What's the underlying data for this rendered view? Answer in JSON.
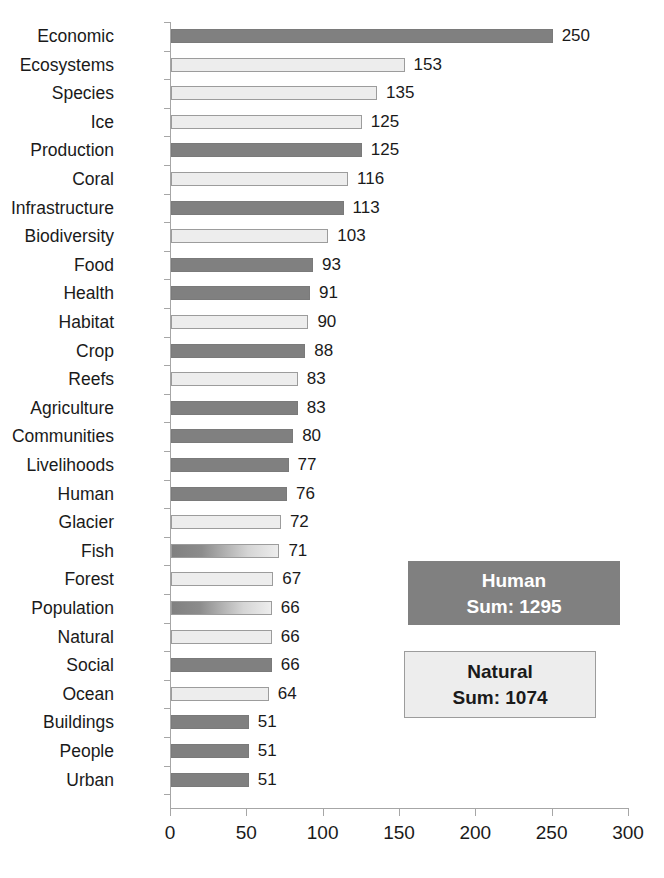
{
  "chart_data": {
    "type": "bar",
    "orientation": "horizontal",
    "title": "",
    "xlabel": "",
    "ylabel": "",
    "xlim": [
      0,
      300
    ],
    "xticks": [
      0,
      50,
      100,
      150,
      200,
      250,
      300
    ],
    "grid": false,
    "legend_position": "inside-right",
    "categories": [
      "Economic",
      "Ecosystems",
      "Species",
      "Ice",
      "Production",
      "Coral",
      "Infrastructure",
      "Biodiversity",
      "Food",
      "Health",
      "Habitat",
      "Crop",
      "Reefs",
      "Agriculture",
      "Communities",
      "Livelihoods",
      "Human",
      "Glacier",
      "Fish",
      "Forest",
      "Population",
      "Natural",
      "Social",
      "Ocean",
      "Buildings",
      "People",
      "Urban"
    ],
    "values": [
      250,
      153,
      135,
      125,
      125,
      116,
      113,
      103,
      93,
      91,
      90,
      88,
      83,
      83,
      80,
      77,
      76,
      72,
      71,
      67,
      66,
      66,
      66,
      64,
      51,
      51,
      51
    ],
    "groups": [
      "human",
      "natural",
      "natural",
      "natural",
      "human",
      "natural",
      "human",
      "natural",
      "human",
      "human",
      "natural",
      "human",
      "natural",
      "human",
      "human",
      "human",
      "human",
      "natural",
      "mixed",
      "natural",
      "mixed",
      "natural",
      "human",
      "natural",
      "human",
      "human",
      "human"
    ],
    "series": [
      {
        "name": "Human",
        "sum": 1295,
        "color": "#808080"
      },
      {
        "name": "Natural",
        "sum": 1074,
        "color": "#ededed"
      }
    ]
  },
  "legend": {
    "human": {
      "name": "Human",
      "sum_label": "Sum: 1295"
    },
    "natural": {
      "name": "Natural",
      "sum_label": "Sum: 1074"
    }
  },
  "colors": {
    "human_fill": "#808080",
    "natural_fill": "#ededed",
    "bar_border": "#9c9c9c",
    "axis": "#a6a6a6",
    "text": "#1a1a1a"
  }
}
